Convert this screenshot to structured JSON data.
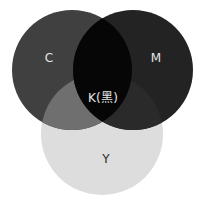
{
  "diagram": {
    "type": "venn",
    "background": "#ffffff",
    "circles": [
      {
        "id": "C",
        "label": "C",
        "cx": 72,
        "cy": 70,
        "r": 60,
        "fill": "#404040"
      },
      {
        "id": "M",
        "label": "M",
        "cx": 133,
        "cy": 70,
        "r": 60,
        "fill": "#232323"
      },
      {
        "id": "Y",
        "label": "Y",
        "cx": 102,
        "cy": 134,
        "r": 61,
        "fill": "#dddddd"
      }
    ],
    "regions": {
      "C_Y": {
        "fill": "#6f6f6f"
      },
      "M_Y": {
        "fill": "#2a2a2a"
      },
      "C_M": {
        "fill": "#060606"
      },
      "C_M_Y": {
        "fill": "#050505"
      }
    },
    "labels": [
      {
        "id": "C",
        "text": "C",
        "x": 49,
        "y": 58,
        "color": "#e6e6e6"
      },
      {
        "id": "M",
        "text": "M",
        "x": 156,
        "y": 58,
        "color": "#e6e6e6"
      },
      {
        "id": "K",
        "text": "K(黑)",
        "x": 103,
        "y": 98,
        "color": "#e6e6e6"
      },
      {
        "id": "Y",
        "text": "Y",
        "x": 106,
        "y": 159,
        "color": "#2b2b2b"
      }
    ]
  }
}
